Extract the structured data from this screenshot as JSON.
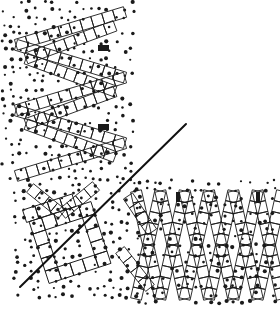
{
  "figure": {
    "title": "Dithered zigzag lattice diagram",
    "background_color": "#ffffff",
    "ink_color": "#1a1a1a",
    "width": 280,
    "height": 311
  },
  "elements": {
    "zigzag_upper_left": {
      "name": "upper-left zigzag chain",
      "bounds": [
        4,
        4,
        135,
        180
      ],
      "turns": 5,
      "cell_size": 11,
      "stroke_width": 0.9
    },
    "zigzag_lower_left": {
      "name": "lower-left tilted cell grid",
      "bounds": [
        20,
        190,
        120,
        295
      ],
      "cell_size": 13,
      "rotation_deg": -18,
      "stroke_width": 0.9
    },
    "zigzag_lower_right": {
      "name": "lower-right diamond chain",
      "bounds": [
        140,
        185,
        278,
        305
      ],
      "peaks": 3,
      "cell_size": 11,
      "stroke_width": 0.9
    },
    "diagonal_rule": {
      "name": "diagonal straight rule",
      "x1": 20,
      "y1": 287,
      "x2": 186,
      "y2": 124,
      "stroke_width": 2.0,
      "color": "#111111"
    }
  },
  "markers": [
    {
      "label": "marker-1",
      "shape": "rect-horizontal",
      "x": 98,
      "y": 45,
      "w": 11,
      "h": 6
    },
    {
      "label": "marker-2",
      "shape": "rect-horizontal",
      "x": 98,
      "y": 124,
      "w": 11,
      "h": 6
    },
    {
      "label": "marker-3",
      "shape": "rect-vertical",
      "x": 176,
      "y": 192,
      "w": 4,
      "h": 10
    },
    {
      "label": "marker-4",
      "shape": "rect-vertical",
      "x": 256,
      "y": 192,
      "w": 4,
      "h": 10
    }
  ],
  "dot_fields": [
    {
      "label": "dot-field-upper-left",
      "x": 4,
      "y": 2,
      "w": 134,
      "h": 182,
      "spacing": 8,
      "radius": 1.5,
      "density": 0.62
    },
    {
      "label": "dot-field-lower-left",
      "x": 16,
      "y": 184,
      "w": 122,
      "h": 116,
      "spacing": 8,
      "radius": 1.5,
      "density": 0.58
    },
    {
      "label": "dot-field-lower-right",
      "x": 138,
      "y": 182,
      "w": 142,
      "h": 126,
      "spacing": 8,
      "radius": 1.5,
      "density": 0.6
    }
  ]
}
